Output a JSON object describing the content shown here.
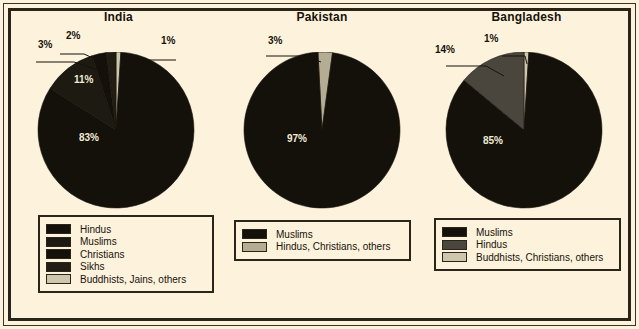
{
  "figure": {
    "background_color": "#fdf3dd",
    "frame_color": "#2b2419",
    "label_text_color": "#17120a",
    "inside_label_color": "#f2ead6"
  },
  "chart_data": [
    {
      "type": "pie",
      "title": "India",
      "categories": [
        "Hindus",
        "Muslims",
        "Christians",
        "Sikhs",
        "Buddhists, Jains, others"
      ],
      "values": [
        83,
        11,
        3,
        2,
        1
      ],
      "labels": [
        "83%",
        "11%",
        "3%",
        "2%",
        "1%"
      ],
      "colors": [
        "#14110b",
        "#1d1a12",
        "#14110b",
        "#211d15",
        "#cfc6ae"
      ],
      "legend": {
        "position": "below",
        "entries": [
          {
            "label": "Hindus",
            "color": "#14110b"
          },
          {
            "label": "Muslims",
            "color": "#1d1a12"
          },
          {
            "label": "Christians",
            "color": "#14110b"
          },
          {
            "label": "Sikhs",
            "color": "#211d15"
          },
          {
            "label": "Buddhists, Jains, others",
            "color": "#cfc6ae"
          }
        ]
      }
    },
    {
      "type": "pie",
      "title": "Pakistan",
      "categories": [
        "Muslims",
        "Hindus, Christians, others"
      ],
      "values": [
        97,
        3
      ],
      "labels": [
        "97%",
        "3%"
      ],
      "colors": [
        "#14110b",
        "#b5ac94"
      ],
      "legend": {
        "position": "below",
        "entries": [
          {
            "label": "Muslims",
            "color": "#14110b"
          },
          {
            "label": "Hindus, Christians, others",
            "color": "#b5ac94"
          }
        ]
      }
    },
    {
      "type": "pie",
      "title": "Bangladesh",
      "categories": [
        "Muslims",
        "Hindus",
        "Buddhists, Christians, others"
      ],
      "values": [
        85,
        14,
        1
      ],
      "labels": [
        "85%",
        "14%",
        "1%"
      ],
      "colors": [
        "#14110b",
        "#4a453d",
        "#cfc6ae"
      ],
      "legend": {
        "position": "below",
        "entries": [
          {
            "label": "Muslims",
            "color": "#14110b"
          },
          {
            "label": "Hindus",
            "color": "#4a453d"
          },
          {
            "label": "Buddhists, Christians, others",
            "color": "#cfc6ae"
          }
        ]
      }
    }
  ]
}
